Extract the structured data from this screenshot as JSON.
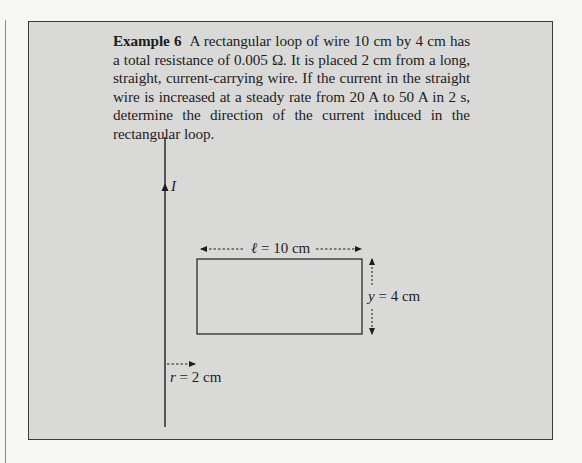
{
  "example": {
    "label": "Example 6",
    "text": "A rectangular loop of wire 10 cm by 4 cm has a total resistance of 0.005 Ω. It is placed 2 cm from a long, straight, current-carrying wire. If the current in the straight wire is increased at a steady rate from 20 A to 50 A in 2 s, determine the direction of the current induced in the rectangular loop."
  },
  "figure": {
    "current_label": "I",
    "length_symbol": "ℓ",
    "length_value": " = 10 cm",
    "width_symbol": "y",
    "width_value": " = 4 cm",
    "distance_symbol": "r",
    "distance_value": " = 2 cm"
  },
  "colors": {
    "box_fill": "#d9d9d8",
    "box_border": "#3a3a3a",
    "page_bg": "#f6f6f5",
    "ink": "#1d1d1d"
  }
}
